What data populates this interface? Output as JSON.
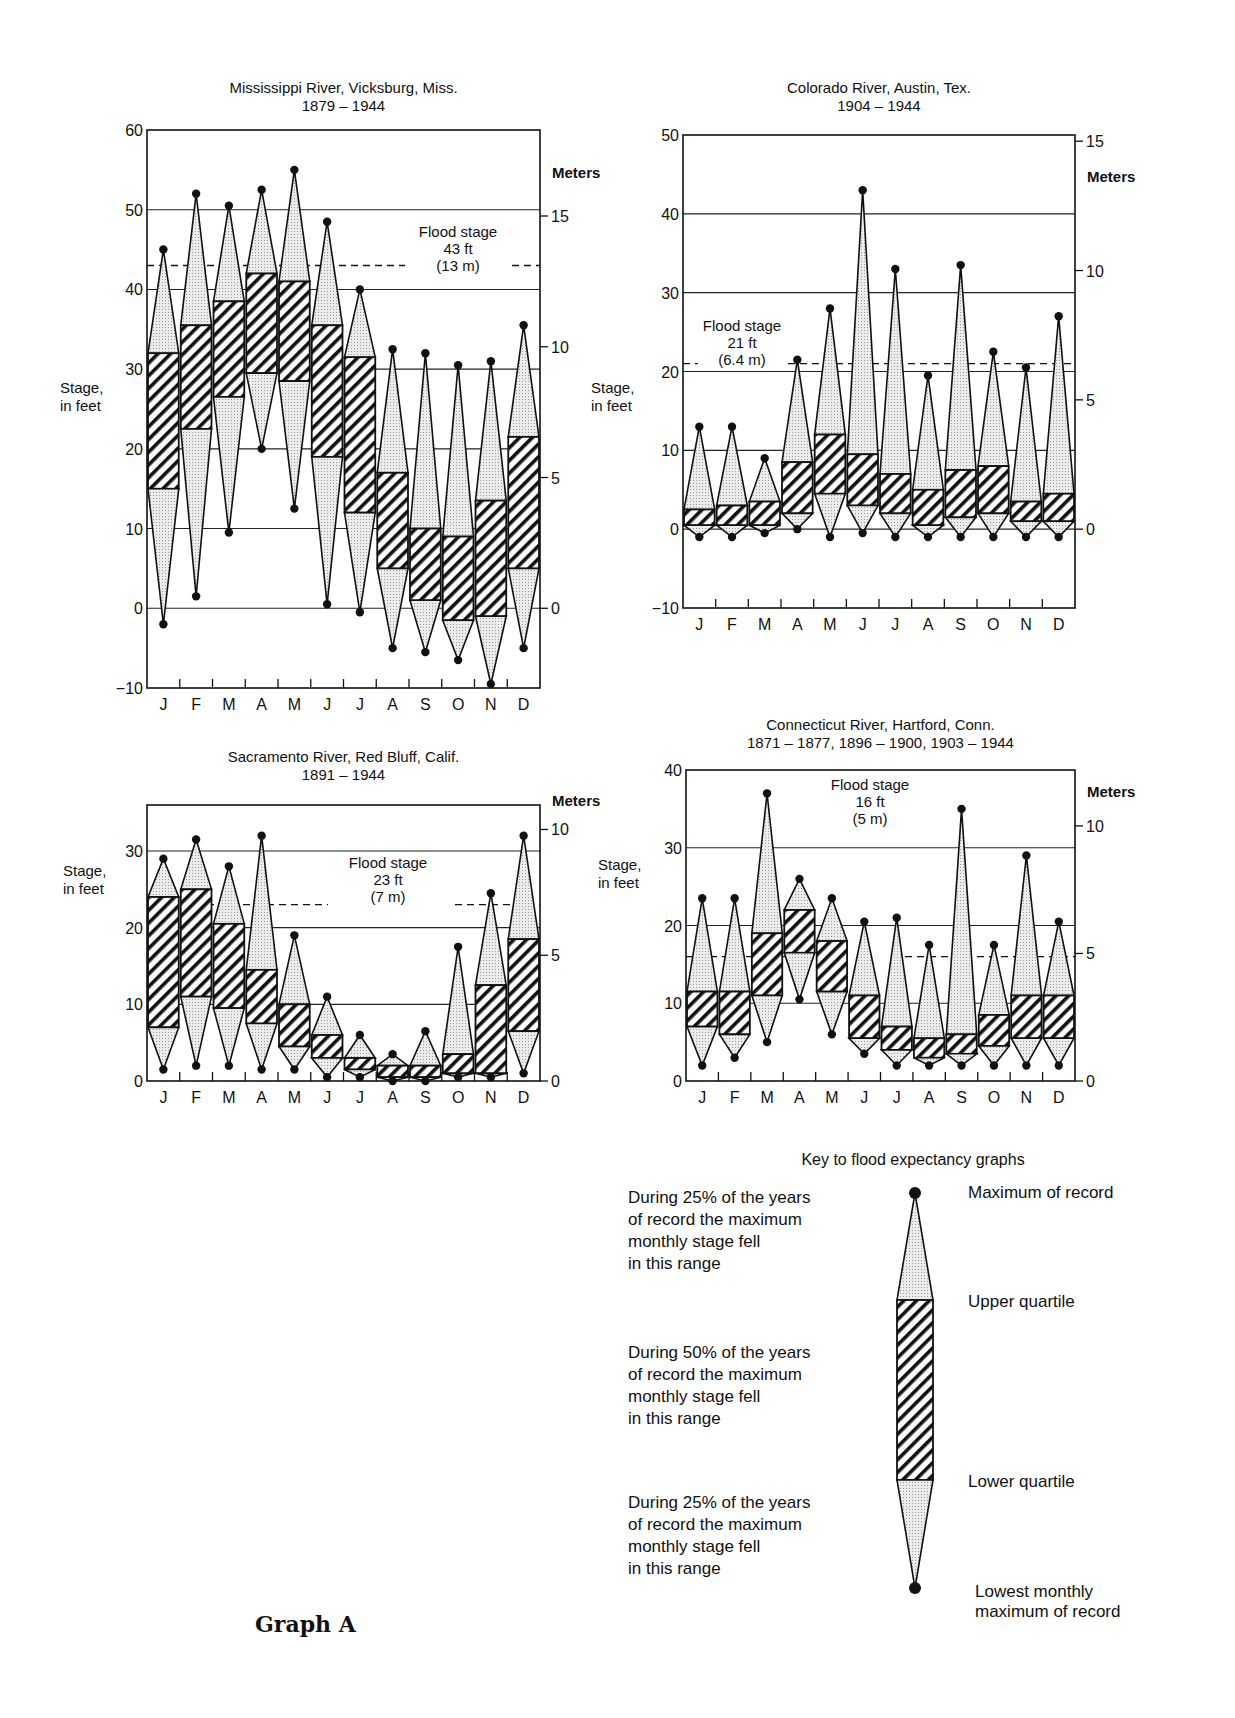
{
  "page": {
    "graph_label": "Graph A"
  },
  "chart_data": [
    {
      "type": "box-range",
      "title": "Mississippi River, Vicksburg, Miss.",
      "subtitle": "1879 – 1944",
      "ylabel_lines": [
        "Stage,",
        "in feet"
      ],
      "y2label": "Meters",
      "ylim": [
        -10,
        60
      ],
      "yticks": [
        -10,
        0,
        10,
        20,
        30,
        40,
        50,
        60
      ],
      "y2ticks": [
        0,
        5,
        10,
        15
      ],
      "gridlines": [
        0,
        10,
        20,
        30,
        40,
        50
      ],
      "flood_stage": {
        "value_ft": 43,
        "lines": [
          "Flood stage",
          "43 ft",
          "(13 m)"
        ]
      },
      "categories": [
        "J",
        "F",
        "M",
        "A",
        "M",
        "J",
        "J",
        "A",
        "S",
        "O",
        "N",
        "D"
      ],
      "max_of_record": [
        45,
        52,
        50.5,
        52.5,
        55,
        48.5,
        40,
        32.5,
        32,
        30.5,
        31,
        35.5
      ],
      "upper_quartile": [
        32,
        35.5,
        38.5,
        42,
        41,
        35.5,
        31.5,
        17,
        10,
        9,
        13.5,
        21.5
      ],
      "lower_quartile": [
        15,
        22.5,
        26.5,
        29.5,
        28.5,
        19,
        12,
        5,
        1,
        -1.5,
        -1,
        5
      ],
      "lowest_max": [
        -2,
        1.5,
        9.5,
        20,
        12.5,
        0.5,
        -0.5,
        -5,
        -5.5,
        -6.5,
        -9.5,
        -5
      ]
    },
    {
      "type": "box-range",
      "title": "Colorado River, Austin, Tex.",
      "subtitle": "1904 – 1944",
      "ylabel_lines": [
        "Stage,",
        "in feet"
      ],
      "y2label": "Meters",
      "ylim": [
        -10,
        50
      ],
      "yticks": [
        -10,
        0,
        10,
        20,
        30,
        40,
        50
      ],
      "y2ticks": [
        0,
        5,
        10,
        15
      ],
      "gridlines": [
        0,
        10,
        20,
        30,
        40
      ],
      "flood_stage": {
        "value_ft": 21,
        "lines": [
          "Flood stage",
          "21 ft",
          "(6.4 m)"
        ]
      },
      "categories": [
        "J",
        "F",
        "M",
        "A",
        "M",
        "J",
        "J",
        "A",
        "S",
        "O",
        "N",
        "D"
      ],
      "max_of_record": [
        13,
        13,
        9,
        21.5,
        28,
        43,
        33,
        19.5,
        33.5,
        22.5,
        20.5,
        27
      ],
      "upper_quartile": [
        2.5,
        3,
        3.5,
        8.5,
        12,
        9.5,
        7,
        5,
        7.5,
        8,
        3.5,
        4.5
      ],
      "lower_quartile": [
        0.5,
        0.5,
        0.5,
        2,
        4.5,
        3,
        2,
        0.5,
        1.5,
        2,
        1,
        1
      ],
      "lowest_max": [
        -1,
        -1,
        -0.5,
        0,
        -1,
        -0.5,
        -1,
        -1,
        -1,
        -1,
        -1,
        -1
      ]
    },
    {
      "type": "box-range",
      "title": "Sacramento River, Red Bluff, Calif.",
      "subtitle": "1891 – 1944",
      "ylabel_lines": [
        "Stage,",
        "in feet"
      ],
      "y2label": "Meters",
      "ylim": [
        0,
        36
      ],
      "yticks": [
        0,
        10,
        20,
        30
      ],
      "y2ticks": [
        0,
        5,
        10
      ],
      "gridlines": [
        10,
        20,
        30
      ],
      "flood_stage": {
        "value_ft": 23,
        "lines": [
          "Flood stage",
          "23 ft",
          "(7 m)"
        ]
      },
      "categories": [
        "J",
        "F",
        "M",
        "A",
        "M",
        "J",
        "J",
        "A",
        "S",
        "O",
        "N",
        "D"
      ],
      "max_of_record": [
        29,
        31.5,
        28,
        32,
        19,
        11,
        6,
        3.5,
        6.5,
        17.5,
        24.5,
        32
      ],
      "upper_quartile": [
        24,
        25,
        20.5,
        14.5,
        10,
        6,
        3,
        2,
        2,
        3.5,
        12.5,
        18.5
      ],
      "lower_quartile": [
        7,
        11,
        9.5,
        7.5,
        4.5,
        3,
        1.5,
        0.5,
        0.5,
        1,
        1,
        6.5
      ],
      "lowest_max": [
        1.5,
        2,
        2,
        1.5,
        1.5,
        0.5,
        0.5,
        0,
        0,
        0.5,
        0.5,
        1
      ]
    },
    {
      "type": "box-range",
      "title": "Connecticut River, Hartford, Conn.",
      "subtitle": "1871 – 1877, 1896 – 1900, 1903 – 1944",
      "ylabel_lines": [
        "Stage,",
        "in feet"
      ],
      "y2label": "Meters",
      "ylim": [
        0,
        40
      ],
      "yticks": [
        0,
        10,
        20,
        30,
        40
      ],
      "y2ticks": [
        0,
        5,
        10
      ],
      "gridlines": [
        10,
        20,
        30
      ],
      "flood_stage": {
        "value_ft": 16,
        "lines": [
          "Flood stage",
          "16 ft",
          "(5 m)"
        ]
      },
      "categories": [
        "J",
        "F",
        "M",
        "A",
        "M",
        "J",
        "J",
        "A",
        "S",
        "O",
        "N",
        "D"
      ],
      "max_of_record": [
        23.5,
        23.5,
        37,
        26,
        23.5,
        20.5,
        21,
        17.5,
        35,
        17.5,
        29,
        20.5
      ],
      "upper_quartile": [
        11.5,
        11.5,
        19,
        22,
        18,
        11,
        7,
        5.5,
        6,
        8.5,
        11,
        11
      ],
      "lower_quartile": [
        7,
        6,
        11,
        16.5,
        11.5,
        5.5,
        4,
        3,
        3.5,
        4.5,
        5.5,
        5.5
      ],
      "lowest_max": [
        2,
        3,
        5,
        10.5,
        6,
        3.5,
        2,
        2,
        2,
        2,
        2,
        2
      ]
    }
  ],
  "key": {
    "title": "Key to flood expectancy graphs",
    "left_texts": [
      [
        "During 25% of the years",
        "of record the maximum",
        "monthly stage fell",
        "in this range"
      ],
      [
        "During 50% of the years",
        "of record the maximum",
        "monthly stage fell",
        "in this range"
      ],
      [
        "During 25% of the years",
        "of record the maximum",
        "monthly stage fell",
        "in this range"
      ]
    ],
    "right_labels": {
      "max": [
        "Maximum of record"
      ],
      "upper": [
        "Upper quartile"
      ],
      "lower": [
        "Lower quartile"
      ],
      "min": [
        "Lowest monthly",
        "maximum of record"
      ]
    }
  }
}
